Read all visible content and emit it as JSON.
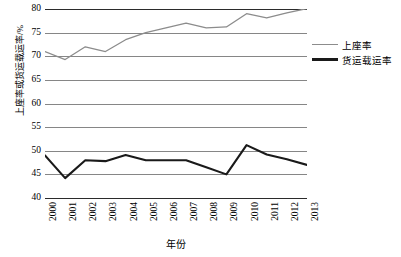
{
  "chart_data": {
    "type": "line",
    "title": "",
    "xlabel": "年份",
    "ylabel": "上座率或货运载运率/%",
    "categories": [
      "2000",
      "2001",
      "2002",
      "2003",
      "2004",
      "2005",
      "2006",
      "2007",
      "2008",
      "2009",
      "2010",
      "2011",
      "2012",
      "2013"
    ],
    "ylim": [
      40,
      80
    ],
    "yticks": [
      40,
      45,
      50,
      55,
      60,
      65,
      70,
      75,
      80
    ],
    "grid": true,
    "legend_position": "right",
    "series": [
      {
        "name": "上座率",
        "color": "#8c8c8c",
        "values": [
          71.0,
          69.3,
          72.0,
          71.0,
          73.5,
          75.0,
          76.0,
          77.0,
          76.0,
          76.2,
          79.0,
          78.1,
          79.2,
          80.1
        ]
      },
      {
        "name": "货运载运率",
        "color": "#1a1a1a",
        "values": [
          49.0,
          44.2,
          48.0,
          47.8,
          49.1,
          48.0,
          48.0,
          48.0,
          46.5,
          45.0,
          51.2,
          49.2,
          48.2,
          47.0
        ]
      }
    ]
  },
  "axis": {
    "y_tick_labels": [
      "80",
      "75",
      "70",
      "65",
      "60",
      "55",
      "50",
      "45",
      "40"
    ],
    "x_tick_labels": [
      "2000",
      "2001",
      "2002",
      "2003",
      "2004",
      "2005",
      "2006",
      "2007",
      "2008",
      "2009",
      "2010",
      "2011",
      "2012",
      "2013"
    ],
    "y_title": "上座率或货运载运率/%",
    "x_title": "年份"
  },
  "legend": {
    "items": [
      {
        "label": "上座率",
        "color": "#8c8c8c",
        "thickness": "1.4px"
      },
      {
        "label": "货运载运率",
        "color": "#1a1a1a",
        "thickness": "2.2px"
      }
    ]
  }
}
